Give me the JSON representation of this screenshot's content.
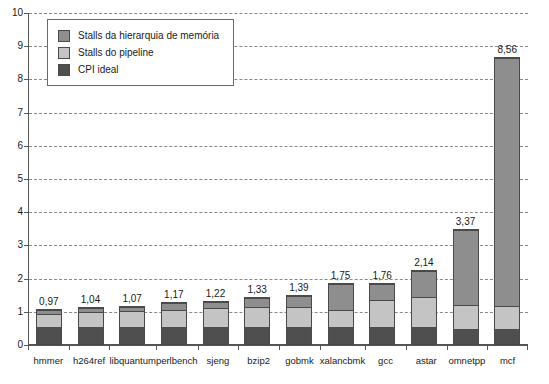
{
  "chart_data": {
    "type": "bar",
    "subtype": "stacked-bar",
    "title": "",
    "xlabel": "",
    "ylabel": "",
    "ylim": [
      0,
      10
    ],
    "ytick_labels": [
      "0",
      "1",
      "2",
      "3",
      "4",
      "5",
      "6",
      "7",
      "8",
      "9",
      "10"
    ],
    "ytick_values": [
      0,
      1,
      2,
      3,
      4,
      5,
      6,
      7,
      8,
      9,
      10
    ],
    "grid": true,
    "grid_style": "dashed-horizontal",
    "legend_position": "upper-left-inside",
    "categories": [
      "hmmer",
      "h264ref",
      "libquantum",
      "perlbench",
      "sjeng",
      "bzip2",
      "gobmk",
      "xalancbmk",
      "gcc",
      "astar",
      "omnetpp",
      "mcf"
    ],
    "series": [
      {
        "name": "CPI ideal",
        "color": "#4f4f4f",
        "values": [
          0.5,
          0.5,
          0.5,
          0.5,
          0.5,
          0.5,
          0.5,
          0.5,
          0.5,
          0.5,
          0.45,
          0.45
        ]
      },
      {
        "name": "Stalls do pipeline",
        "color": "#c4c4c4",
        "values": [
          0.37,
          0.42,
          0.45,
          0.5,
          0.55,
          0.6,
          0.6,
          0.5,
          0.8,
          0.9,
          0.7,
          0.65
        ]
      },
      {
        "name": "Stalls da hierarquia de memória",
        "color": "#8e8e8e",
        "values": [
          0.1,
          0.12,
          0.12,
          0.17,
          0.17,
          0.23,
          0.29,
          0.75,
          0.46,
          0.74,
          2.22,
          7.46
        ]
      }
    ],
    "totals": [
      0.97,
      1.04,
      1.07,
      1.17,
      1.22,
      1.33,
      1.39,
      1.75,
      1.76,
      2.14,
      3.37,
      8.56
    ],
    "data_labels": [
      "0,97",
      "1,04",
      "1,07",
      "1,17",
      "1,22",
      "1,33",
      "1,39",
      "1,75",
      "1,76",
      "2,14",
      "3,37",
      "8,56"
    ],
    "legend": [
      {
        "label": "Stalls da hierarquia de memória",
        "color": "#8e8e8e",
        "swatch": "sw-memory"
      },
      {
        "label": "Stalls do pipeline",
        "color": "#c4c4c4",
        "swatch": "sw-pipeline"
      },
      {
        "label": "CPI ideal",
        "color": "#4f4f4f",
        "swatch": "sw-ideal"
      }
    ]
  },
  "colors": {
    "memory_stalls": "#8e8e8e",
    "pipeline_stalls": "#c4c4c4",
    "cpi_ideal": "#4f4f4f",
    "axis": "#555555",
    "grid": "#888888",
    "background": "#ffffff"
  }
}
